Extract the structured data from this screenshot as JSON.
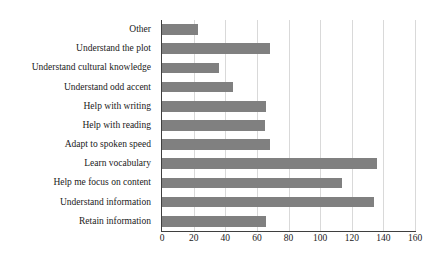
{
  "chart_data": {
    "type": "bar",
    "orientation": "horizontal",
    "title": "",
    "xlabel": "",
    "ylabel": "",
    "xlim": [
      0,
      160
    ],
    "ylim": null,
    "grid": true,
    "legend": false,
    "xticks": [
      0,
      20,
      40,
      60,
      80,
      100,
      120,
      140,
      160
    ],
    "xtick_labels": [
      "0",
      "20",
      "40",
      "60",
      "80",
      "100",
      "120",
      "140",
      "160"
    ],
    "categories": [
      "Other",
      "Understand the plot",
      "Understand cultural knowledge",
      "Understand odd accent",
      "Help with writing",
      "Help with reading",
      "Adapt to spoken speed",
      "Learn vocabulary",
      "Help me focus on content",
      "Understand information",
      "Retain information"
    ],
    "values": [
      23,
      68,
      36,
      45,
      66,
      65,
      68,
      136,
      114,
      134,
      66
    ],
    "bar_color": "#808080",
    "gridline_color": "#d9d9d9",
    "axis_color": "#3f3f3f",
    "text_color": "#1a1a1a"
  }
}
